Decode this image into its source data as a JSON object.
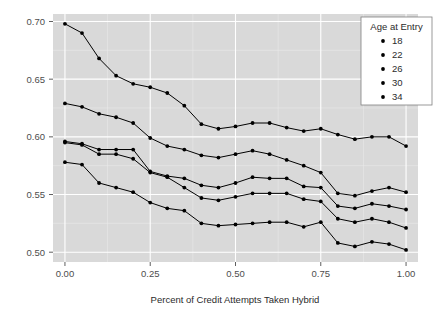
{
  "chart_data": {
    "type": "line",
    "title": "",
    "subtitle": "",
    "xlabel": "Percent of Credit Attempts Taken Hybrid",
    "ylabel": "",
    "xlim": [
      -0.035,
      1.035
    ],
    "ylim": [
      0.4915,
      0.7065
    ],
    "xticks": [
      0.0,
      0.25,
      0.5,
      0.75,
      1.0
    ],
    "xticklabels": [
      "0.00",
      "0.25",
      "0.50",
      "0.75",
      "1.00"
    ],
    "yticks": [
      0.5,
      0.55,
      0.6,
      0.65,
      0.7
    ],
    "yticklabels": [
      "0.50",
      "0.55",
      "0.60",
      "0.65",
      "0.70"
    ],
    "grid": true,
    "grid_minor": true,
    "legend": {
      "title": "Age at Entry",
      "position": "top-right-inside",
      "entries": [
        "18",
        "22",
        "26",
        "30",
        "34"
      ]
    },
    "marker": "circle",
    "line_color": "#000000",
    "panel_color": "#d9d9d9",
    "grid_color": "#ffffff",
    "x": [
      0.0,
      0.05,
      0.1,
      0.15,
      0.2,
      0.25,
      0.3,
      0.35,
      0.4,
      0.45,
      0.5,
      0.55,
      0.6,
      0.65,
      0.7,
      0.75,
      0.8,
      0.85,
      0.9,
      0.95,
      1.0
    ],
    "series": [
      {
        "name": "18",
        "values": [
          0.698,
          0.69,
          0.668,
          0.653,
          0.646,
          0.643,
          0.638,
          0.627,
          0.611,
          0.607,
          0.609,
          0.612,
          0.612,
          0.608,
          0.605,
          0.607,
          0.602,
          0.598,
          0.6,
          0.6,
          0.592
        ]
      },
      {
        "name": "22",
        "values": [
          0.629,
          0.626,
          0.62,
          0.617,
          0.612,
          0.599,
          0.592,
          0.589,
          0.584,
          0.582,
          0.585,
          0.588,
          0.585,
          0.58,
          0.575,
          0.569,
          0.551,
          0.549,
          0.553,
          0.556,
          0.552
        ]
      },
      {
        "name": "26",
        "values": [
          0.596,
          0.594,
          0.589,
          0.589,
          0.589,
          0.57,
          0.566,
          0.564,
          0.558,
          0.556,
          0.56,
          0.565,
          0.564,
          0.564,
          0.557,
          0.556,
          0.54,
          0.538,
          0.542,
          0.54,
          0.537
        ]
      },
      {
        "name": "30",
        "values": [
          0.595,
          0.593,
          0.585,
          0.585,
          0.581,
          0.569,
          0.565,
          0.556,
          0.547,
          0.545,
          0.548,
          0.551,
          0.551,
          0.551,
          0.546,
          0.544,
          0.529,
          0.526,
          0.529,
          0.526,
          0.521
        ]
      },
      {
        "name": "34",
        "values": [
          0.578,
          0.576,
          0.56,
          0.556,
          0.552,
          0.543,
          0.538,
          0.536,
          0.525,
          0.523,
          0.524,
          0.525,
          0.526,
          0.526,
          0.522,
          0.526,
          0.508,
          0.505,
          0.509,
          0.507,
          0.502
        ]
      }
    ]
  }
}
